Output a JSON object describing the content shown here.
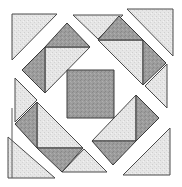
{
  "diagram": {
    "colors": {
      "background": "#ffffff",
      "light_fill": "#e2e2e2",
      "dark_fill": "#9a9a9a",
      "stroke": "#444444"
    },
    "center_square": {
      "name": "center-square",
      "tone": "dark",
      "points": "67,70 114,70 114,118 67,118"
    },
    "pieces": [
      {
        "name": "corner-triangle-top-left",
        "tone": "light",
        "points": "12,14 57,14 12,60"
      },
      {
        "name": "corner-triangle-top-right",
        "tone": "light",
        "points": "127,9 173,9 173,56"
      },
      {
        "name": "corner-triangle-bottom-left",
        "tone": "light",
        "points": "8,137 55,178 8,178"
      },
      {
        "name": "corner-triangle-bottom-right",
        "tone": "light",
        "points": "170,128 170,175 123,175"
      },
      {
        "name": "side-triangle-top",
        "tone": "light",
        "points": "73,15 123,15 98,39"
      },
      {
        "name": "side-triangle-left",
        "tone": "light",
        "points": "15,78 15,122 37,100"
      },
      {
        "name": "side-triangle-right",
        "tone": "light",
        "points": "167,64 167,108 145,86"
      },
      {
        "name": "side-triangle-bottom",
        "tone": "light",
        "points": "84,149 62,172 107,172"
      },
      {
        "name": "unit-top-left-light",
        "tone": "light",
        "points": "45,47 90,47 45,93"
      },
      {
        "name": "unit-top-left-dark-top",
        "tone": "dark",
        "points": "67,23 45,47 90,47"
      },
      {
        "name": "unit-top-left-dark-left",
        "tone": "dark",
        "points": "22,70 45,47 45,93"
      },
      {
        "name": "unit-top-right-light",
        "tone": "light",
        "points": "98,40 143,40 143,85"
      },
      {
        "name": "unit-top-right-dark-top",
        "tone": "dark",
        "points": "119,16 98,40 143,40"
      },
      {
        "name": "unit-top-right-dark-right",
        "tone": "dark",
        "points": "166,63 143,40 143,85"
      },
      {
        "name": "unit-bottom-left-light",
        "tone": "light",
        "points": "37,102 37,148 83,148"
      },
      {
        "name": "unit-bottom-left-dark-left",
        "tone": "dark",
        "points": "15,124 37,102 37,148"
      },
      {
        "name": "unit-bottom-left-dark-bottom",
        "tone": "dark",
        "points": "62,172 37,148 83,148"
      },
      {
        "name": "unit-bottom-right-light",
        "tone": "light",
        "points": "136,95 136,141 92,141"
      },
      {
        "name": "unit-bottom-right-dark-right",
        "tone": "dark",
        "points": "159,118 136,95 136,141"
      },
      {
        "name": "unit-bottom-right-dark-bottom",
        "tone": "dark",
        "points": "113,165 92,141 136,141"
      }
    ]
  }
}
